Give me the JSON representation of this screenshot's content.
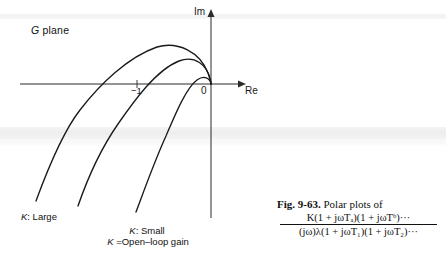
{
  "figure": {
    "plane_label_symbol": "G",
    "plane_label_word": " plane",
    "axis_imaginary": "Im",
    "axis_real": "Re",
    "origin_label": "0",
    "critical_point_label": "−1",
    "curve_label_large": "K",
    "curve_label_large_text": ": Large",
    "curve_label_small": "K",
    "curve_label_small_text": ": Small",
    "gain_definition_symbol": "K",
    "gain_definition_text": " =Open–loop gain"
  },
  "caption": {
    "figure_number": "Fig. 9-63.",
    "caption_text": " Polar plots of",
    "numerator": "K(1 + jωTₐ)(1 + jωTᵇ)···",
    "denominator": "(jω)λ(1 + jωT₁)(1 + jωT₂)···"
  },
  "chart_data": {
    "type": "line",
    "xlabel": "Re",
    "ylabel": "Im",
    "grid": false,
    "legend_position": "inline-annotations",
    "annotations": [
      {
        "text": "G plane",
        "x": 31,
        "y": 25
      },
      {
        "text": "−1",
        "x": 131,
        "y": 86
      },
      {
        "text": "0",
        "x": 201,
        "y": 86
      },
      {
        "text": "K: Large",
        "x": 21,
        "y": 212
      },
      {
        "text": "K: Small",
        "x": 112,
        "y": 226
      },
      {
        "text": "K =Open-loop gain",
        "x": 93,
        "y": 237
      }
    ],
    "axes": {
      "origin_px": [
        211,
        84
      ],
      "real_axis_from_px": [
        20,
        84
      ],
      "real_axis_to_px": [
        243,
        84
      ],
      "imag_axis_from_px": [
        211,
        218
      ],
      "imag_axis_to_px": [
        211,
        10
      ],
      "minus_one_px": [
        137,
        84
      ]
    },
    "series": [
      {
        "name": "K: Large",
        "description": "Outermost polar plot; largest gain, crosses negative real axis farthest from origin",
        "real_axis_crossing_px_x": 96,
        "peak_px": [
          165,
          45
        ],
        "tail_end_px": [
          36,
          201
        ],
        "path": "M 36 201 C 47 171, 62 133, 80 110 C 100 84, 128 57, 157 47 C 178 41, 200 52, 208 73 C 210 78, 211 82, 211 84"
      },
      {
        "name": "K: Medium",
        "description": "Middle polar plot, intermediate gain",
        "real_axis_crossing_px_x": 133,
        "peak_px": [
          176,
          59
        ],
        "tail_end_px": [
          78,
          206
        ],
        "path": "M 78 206 C 88 177, 102 147, 118 124 C 134 101, 156 70, 179 61 C 195 55, 207 65, 210 79 C 211 82, 211 83, 211 84"
      },
      {
        "name": "K: Small",
        "description": "Innermost polar plot; smallest gain, crosses real axis closest to origin",
        "real_axis_crossing_px_x": 170,
        "peak_px": [
          192,
          78
        ],
        "tail_end_px": [
          136,
          212
        ],
        "path": "M 136 212 C 145 188, 155 160, 166 136 C 175 115, 186 88, 197 80 C 204 75, 210 78, 211 84"
      }
    ]
  }
}
